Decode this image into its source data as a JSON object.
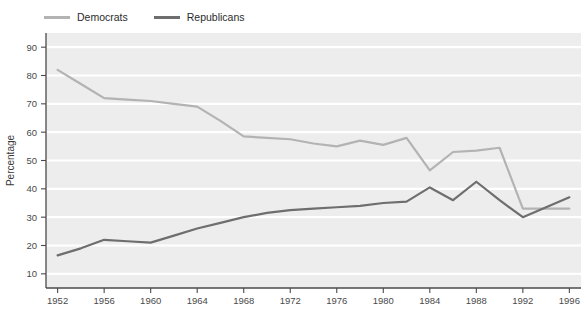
{
  "chart_data": {
    "type": "line",
    "title": "",
    "xlabel": "",
    "ylabel": "Percentage",
    "xlim": [
      1951,
      1997
    ],
    "ylim": [
      5,
      95
    ],
    "yticks": [
      10,
      20,
      30,
      40,
      50,
      60,
      70,
      80,
      90
    ],
    "xticks": [
      1952,
      1956,
      1960,
      1964,
      1968,
      1972,
      1976,
      1980,
      1984,
      1988,
      1992,
      1996
    ],
    "grid": "horizontal-white-on-gray",
    "legend_position": "above-left",
    "plot_background": "#ededed",
    "x": [
      1952,
      1954,
      1956,
      1958,
      1960,
      1962,
      1964,
      1966,
      1968,
      1970,
      1972,
      1974,
      1976,
      1978,
      1980,
      1982,
      1984,
      1986,
      1988,
      1990,
      1992,
      1994,
      1996
    ],
    "series": [
      {
        "name": "Democrats",
        "color": "#b3b3b3",
        "values": [
          82,
          77,
          72,
          71.5,
          71,
          70,
          69,
          64,
          58.5,
          58,
          57.5,
          56,
          55,
          57,
          55.5,
          58,
          46.5,
          53,
          53.5,
          54.5,
          33,
          33,
          33
        ]
      },
      {
        "name": "Republicans",
        "color": "#6e6e6e",
        "values": [
          16.5,
          19,
          22,
          21.5,
          21,
          23.5,
          26,
          28,
          30,
          31.5,
          32.5,
          33,
          33.5,
          34,
          35,
          35.5,
          40.5,
          36,
          42.5,
          36,
          30,
          33.5,
          37
        ]
      }
    ]
  },
  "legend": {
    "entries": [
      {
        "label": "Democrats"
      },
      {
        "label": "Republicans"
      }
    ]
  },
  "axes": {
    "y_axis_label": "Percentage"
  }
}
